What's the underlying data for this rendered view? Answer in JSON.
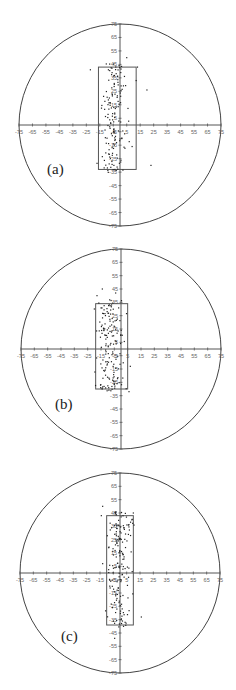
{
  "chart_data": [
    {
      "type": "scatter",
      "panel_label": "(a)",
      "title": "",
      "xlabel": "",
      "ylabel": "",
      "xlim": [
        -75,
        75
      ],
      "ylim": [
        -75,
        75
      ],
      "x_ticks": [
        "-75",
        "-65",
        "-55",
        "-45",
        "-35",
        "-25",
        "-15",
        "-5",
        "5",
        "15",
        "25",
        "35",
        "45",
        "55",
        "65",
        "75"
      ],
      "y_ticks": [
        "75",
        "65",
        "55",
        "45",
        "35",
        "25",
        "15",
        "5",
        "-5",
        "-15",
        "-25",
        "-35",
        "-45",
        "-55",
        "-65",
        "-75"
      ],
      "boundary": {
        "shape": "circle",
        "radius": 75
      },
      "rectangle": {
        "x_min": -16,
        "x_max": 12,
        "y_min": -33,
        "y_max": 43
      },
      "cluster": {
        "x_center": -5,
        "x_spread": 8,
        "y_min": -36,
        "y_max": 46,
        "n": 150,
        "seed": 11,
        "outliers": [
          [
            20,
            26
          ],
          [
            23,
            -30
          ],
          [
            9,
            -16
          ],
          [
            5,
            50
          ],
          [
            13,
            43
          ],
          [
            -22,
            41
          ],
          [
            12,
            33
          ]
        ]
      },
      "layout": {
        "top": 0,
        "cx": 120,
        "cy": 125,
        "r": 101
      },
      "label_pos": {
        "left": 47,
        "top": 161
      }
    },
    {
      "type": "scatter",
      "panel_label": "(b)",
      "title": "",
      "xlabel": "",
      "ylabel": "",
      "xlim": [
        -75,
        75
      ],
      "ylim": [
        -75,
        75
      ],
      "x_ticks": [
        "-75",
        "-65",
        "-55",
        "-45",
        "-35",
        "-25",
        "-15",
        "-5",
        "5",
        "15",
        "25",
        "35",
        "45",
        "55",
        "65",
        "75"
      ],
      "y_ticks": [
        "75",
        "65",
        "55",
        "45",
        "35",
        "25",
        "15",
        "5",
        "-5",
        "-15",
        "-25",
        "-35",
        "-45",
        "-55",
        "-65",
        "-75"
      ],
      "boundary": {
        "shape": "circle",
        "radius": 75
      },
      "rectangle": {
        "x_min": -19,
        "x_max": 5,
        "y_min": -30,
        "y_max": 34
      },
      "cluster": {
        "x_center": -8,
        "x_spread": 9,
        "y_min": -32,
        "y_max": 37,
        "n": 160,
        "seed": 23,
        "outliers": [
          [
            -14,
            45
          ],
          [
            -18,
            40
          ],
          [
            -20,
            30
          ],
          [
            7,
            -13
          ],
          [
            6,
            -32
          ],
          [
            -4,
            42
          ]
        ]
      },
      "layout": {
        "top": 224,
        "cx": 121,
        "cy": 125,
        "r": 100
      },
      "label_pos": {
        "left": 55,
        "top": 172
      }
    },
    {
      "type": "scatter",
      "panel_label": "(c)",
      "title": "",
      "xlabel": "",
      "ylabel": "",
      "xlim": [
        -75,
        75
      ],
      "ylim": [
        -75,
        75
      ],
      "x_ticks": [
        "-75",
        "-65",
        "-55",
        "-45",
        "-35",
        "-25",
        "-15",
        "-5",
        "5",
        "15",
        "25",
        "35",
        "45",
        "55",
        "65",
        "75"
      ],
      "y_ticks": [
        "75",
        "65",
        "55",
        "45",
        "35",
        "25",
        "15",
        "5",
        "-5",
        "-15",
        "-25",
        "-35",
        "-45",
        "-55",
        "-65",
        "-75"
      ],
      "boundary": {
        "shape": "circle",
        "radius": 75
      },
      "rectangle": {
        "x_min": -10,
        "x_max": 10,
        "y_min": -39,
        "y_max": 43
      },
      "cluster": {
        "x_center": 0,
        "x_spread": 8,
        "y_min": -41,
        "y_max": 46,
        "n": 170,
        "seed": 37,
        "outliers": [
          [
            -13,
            50
          ],
          [
            -14,
            43
          ],
          [
            -13,
            7
          ],
          [
            16,
            -33
          ],
          [
            10,
            45
          ],
          [
            -4,
            -49
          ]
        ]
      },
      "layout": {
        "top": 448,
        "cx": 120,
        "cy": 125,
        "r": 100
      },
      "label_pos": {
        "left": 61,
        "top": 180
      }
    }
  ],
  "colors": {
    "axis": "#555555",
    "circle": "#444444",
    "rect": "#555555",
    "point": "#222222",
    "tick_text": "#666666"
  }
}
